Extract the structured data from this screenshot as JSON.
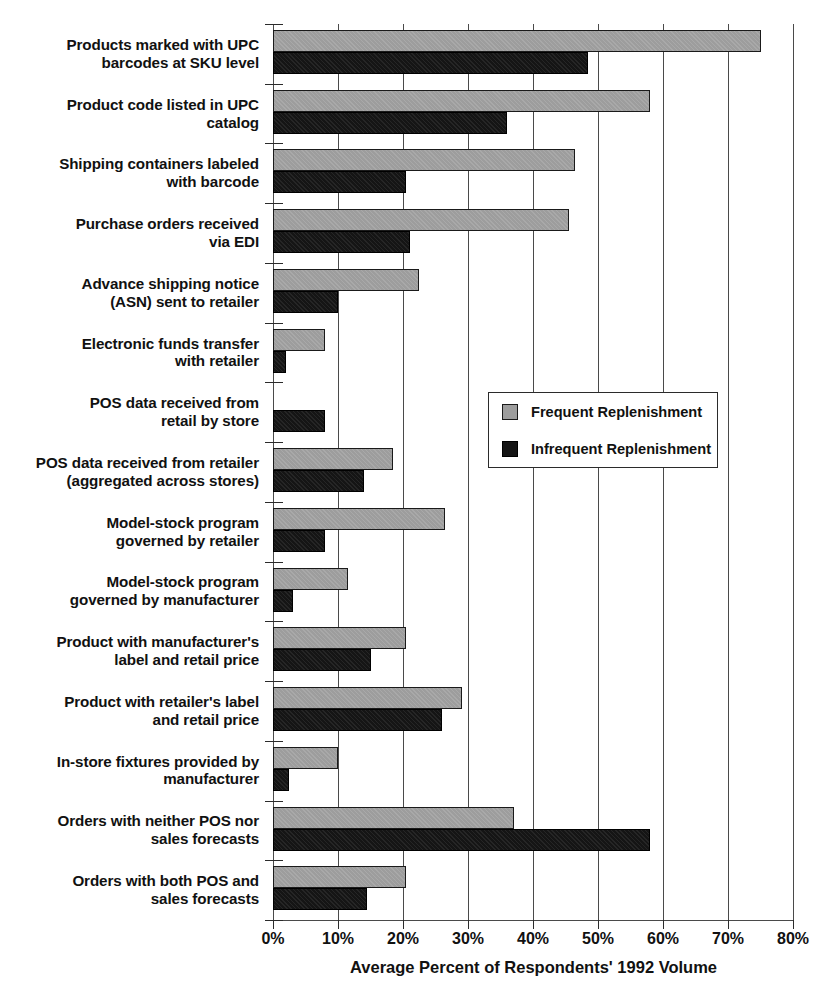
{
  "chart_data": {
    "type": "bar",
    "orientation": "horizontal",
    "title": "",
    "xlabel": "Average Percent of Respondents' 1992 Volume",
    "ylabel": "",
    "xlim": [
      0,
      80
    ],
    "xticks": [
      0,
      10,
      20,
      30,
      40,
      50,
      60,
      70,
      80
    ],
    "xtick_labels": [
      "0%",
      "10%",
      "20%",
      "30%",
      "40%",
      "50%",
      "60%",
      "70%",
      "80%"
    ],
    "grid": true,
    "legend_position": "center-right",
    "categories": [
      "Products marked with UPC barcodes at SKU level",
      "Product code listed in UPC catalog",
      "Shipping containers labeled with barcode",
      "Purchase orders received via EDI",
      "Advance shipping notice (ASN) sent to retailer",
      "Electronic funds transfer with retailer",
      "POS data received from retail by store",
      "POS data received from retailer (aggregated across stores)",
      "Model-stock program governed by retailer",
      "Model-stock program governed by manufacturer",
      "Product with manufacturer's label and retail price",
      "Product with retailer's label and retail price",
      "In-store fixtures provided by manufacturer",
      "Orders with neither POS nor sales forecasts",
      "Orders with both POS and sales forecasts"
    ],
    "category_lines": [
      [
        "Products marked with UPC",
        "barcodes at SKU level"
      ],
      [
        "Product code listed in UPC",
        "catalog"
      ],
      [
        "Shipping containers labeled",
        "with barcode"
      ],
      [
        "Purchase orders received",
        "via EDI"
      ],
      [
        "Advance shipping notice",
        "(ASN) sent to retailer"
      ],
      [
        "Electronic funds transfer",
        "with retailer"
      ],
      [
        "POS data received from",
        "retail by store"
      ],
      [
        "POS data received from retailer",
        "(aggregated across stores)"
      ],
      [
        "Model-stock program",
        "governed by retailer"
      ],
      [
        "Model-stock program",
        "governed by manufacturer"
      ],
      [
        "Product with manufacturer's",
        "label and retail price"
      ],
      [
        "Product with retailer's label",
        "and retail price"
      ],
      [
        "In-store fixtures provided by",
        "manufacturer"
      ],
      [
        "Orders with neither POS nor",
        "sales forecasts"
      ],
      [
        "Orders with both POS and",
        "sales forecasts"
      ]
    ],
    "series": [
      {
        "name": "Frequent Replenishment",
        "color": "#9d9d9d",
        "values": [
          75,
          58,
          46.5,
          45.5,
          22.5,
          8,
          0,
          18.5,
          26.5,
          11.5,
          20.5,
          29,
          10,
          37,
          20.5
        ]
      },
      {
        "name": "Infrequent Replenishment",
        "color": "#151515",
        "values": [
          48.5,
          36,
          20.5,
          21,
          10,
          2,
          8,
          14,
          8,
          3,
          15,
          26,
          2.5,
          58,
          14.5
        ]
      }
    ]
  },
  "legend": {
    "items": [
      {
        "label": "Frequent Replenishment",
        "swatch": "frequent"
      },
      {
        "label": "Infrequent Replenishment",
        "swatch": "infrequent"
      }
    ]
  },
  "axis": {
    "x_title": "Average Percent of Respondents' 1992 Volume"
  }
}
